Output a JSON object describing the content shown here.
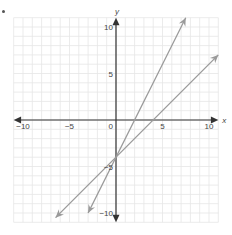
{
  "bullet": "•",
  "chart_data": {
    "type": "line",
    "title": "",
    "xlabel": "x",
    "ylabel": "y",
    "xlim": [
      -11,
      11
    ],
    "ylim": [
      -11,
      11
    ],
    "grid": true,
    "x_ticks": [
      -10,
      -5,
      0,
      5,
      10
    ],
    "y_ticks": [
      10,
      5,
      -5,
      -10
    ],
    "tick_labels": {
      "x": [
        "−10",
        "−5",
        "0",
        "5",
        "10"
      ],
      "y": [
        "10",
        "5",
        "−5",
        "−10"
      ]
    },
    "series": [
      {
        "name": "line-steep",
        "equation": "y = 2x − 4",
        "slope": 2,
        "intercept": -4,
        "x": [
          -3,
          7.5
        ],
        "y": [
          -10,
          11
        ],
        "color": "#999999",
        "arrows": "both"
      },
      {
        "name": "line-shallow",
        "equation": "y = x − 4",
        "slope": 1,
        "intercept": -4,
        "x": [
          -6.5,
          11
        ],
        "y": [
          -10.5,
          7
        ],
        "color": "#999999",
        "arrows": "both"
      }
    ],
    "colors": {
      "axis": "#333333",
      "grid": "#e6e6e6",
      "lines": "#9a9a9a",
      "text": "#444444"
    }
  }
}
